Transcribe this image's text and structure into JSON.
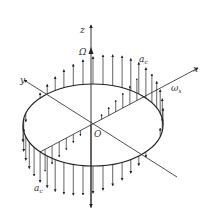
{
  "diagram": {
    "type": "rotating disk with Coriolis acceleration distribution",
    "colors": {
      "line": "#222222",
      "background": "#ffffff"
    },
    "axes": {
      "z": {
        "label": "z"
      },
      "x": {
        "label": "x"
      },
      "y": {
        "label": "y"
      }
    },
    "labels": {
      "Omega": "Ω",
      "omega_x": "ω",
      "omega_x_sub": "x",
      "a_top": "a",
      "a_top_sub": "c",
      "a_bottom": "a",
      "a_bottom_sub": "c",
      "origin": "O"
    },
    "arrows": {
      "upward_side": "right/back half of disk",
      "downward_side": "left/front half of disk"
    }
  }
}
